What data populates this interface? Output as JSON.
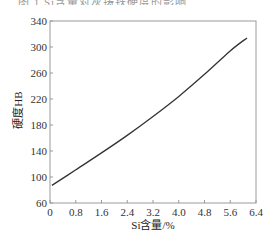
{
  "top_caption_fragment": "图 1  Si含量对灰铸铁硬度的影响",
  "chart_data": {
    "type": "line",
    "title": "",
    "xlabel": "Si含量/%",
    "ylabel": "硬度HB",
    "xlim": [
      0,
      6.4
    ],
    "ylim": [
      60,
      340
    ],
    "xticks": [
      "0",
      "0.8",
      "1.6",
      "2.4",
      "3.2",
      "4.0",
      "4.8",
      "5.6",
      "6.4"
    ],
    "yticks": [
      "60",
      "100",
      "140",
      "180",
      "220",
      "260",
      "300",
      "340"
    ],
    "grid": false,
    "legend": null,
    "series": [
      {
        "name": "硬度",
        "x": [
          0.06,
          0.8,
          1.6,
          2.4,
          3.2,
          4.0,
          4.8,
          5.6,
          6.12
        ],
        "y": [
          87,
          111,
          137,
          164,
          193,
          224,
          258,
          294,
          314
        ]
      }
    ]
  }
}
